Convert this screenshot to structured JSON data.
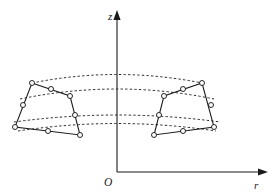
{
  "figure": {
    "background_color": "#ffffff",
    "line_color": "#1a1a1a",
    "dash_color": "#2b2b2b",
    "node_fill_color": "#ffffff",
    "width": 271,
    "height": 196
  },
  "axes": {
    "vertical": {
      "label": "z",
      "label_x": 110,
      "label_y": 19,
      "x": 117,
      "y_top": 16,
      "y_bottom": 172
    },
    "horizontal": {
      "label": "r",
      "label_x": 256,
      "label_y": 188,
      "y": 172,
      "x_left": 117,
      "x_right": 264
    },
    "origin": {
      "label": "O",
      "label_x": 106,
      "label_y": 185,
      "x": 117,
      "y": 172
    }
  },
  "guide_arcs": [
    {
      "name": "outer-top-arc",
      "path": "M 32 83 Q 117 66 202 83",
      "style": "dashed"
    },
    {
      "name": "inner-top-arc",
      "path": "M 20 99 Q 117 79 214 99",
      "style": "dashed"
    },
    {
      "name": "inner-bottom-arc",
      "path": "M 14 122 Q 117 108 220 122",
      "style": "dashed"
    },
    {
      "name": "outer-bottom-arc",
      "path": "M 18 131 Q 117 116 216 131",
      "style": "dashed"
    }
  ],
  "elements": [
    {
      "name": "left-element",
      "type": "8-node-quadrilateral",
      "outline": "M 32 83 L 70 96 L 80 135 L 15 127 Z",
      "nodes": [
        {
          "name": "corner-top-left",
          "x": 32,
          "y": 83
        },
        {
          "name": "midside-top",
          "x": 51,
          "y": 89
        },
        {
          "name": "corner-top-right",
          "x": 70,
          "y": 96
        },
        {
          "name": "midside-right",
          "x": 75,
          "y": 115
        },
        {
          "name": "corner-bottom-right",
          "x": 80,
          "y": 135
        },
        {
          "name": "midside-bottom",
          "x": 48,
          "y": 131
        },
        {
          "name": "corner-bottom-left",
          "x": 15,
          "y": 127
        },
        {
          "name": "midside-left",
          "x": 23,
          "y": 105
        }
      ]
    },
    {
      "name": "right-element",
      "type": "8-node-quadrilateral",
      "outline": "M 202 83 L 214 127 L 154 135 L 164 96 Z",
      "nodes": [
        {
          "name": "corner-top-right",
          "x": 202,
          "y": 83
        },
        {
          "name": "midside-right",
          "x": 211,
          "y": 105
        },
        {
          "name": "corner-bottom-right",
          "x": 214,
          "y": 127
        },
        {
          "name": "midside-bottom",
          "x": 183,
          "y": 131
        },
        {
          "name": "corner-bottom-left",
          "x": 154,
          "y": 135
        },
        {
          "name": "midside-left",
          "x": 159,
          "y": 115
        },
        {
          "name": "corner-top-left",
          "x": 164,
          "y": 96
        },
        {
          "name": "midside-top",
          "x": 183,
          "y": 89
        }
      ]
    }
  ]
}
